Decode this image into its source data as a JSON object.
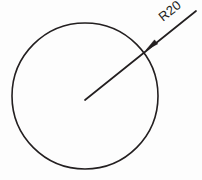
{
  "drawing": {
    "title": "Circle with radius dimension",
    "background_color": "#fdfdfd",
    "line_color": "#231f20",
    "width": 202,
    "height": 180
  },
  "circle": {
    "name": "circle",
    "center_x": 85,
    "center_y": 96,
    "radius_px": 73,
    "stroke_width": 1.6
  },
  "leader": {
    "name": "radius-leader-line",
    "start_x": 85,
    "start_y": 100,
    "end_x": 196,
    "end_y": 11,
    "arrow_x": 146,
    "arrow_y": 50,
    "angle_deg": -38.7
  },
  "dimension": {
    "label": "R20",
    "prefix": "R",
    "value": 20,
    "rotation_deg": -38.7,
    "text_x": 163,
    "text_y": 22
  },
  "chart_data": {
    "type": "diagram",
    "annotations": [
      "R20"
    ],
    "entities": [
      {
        "kind": "circle",
        "center": [
          85,
          96
        ],
        "radius": 73,
        "label": "circle-outline"
      },
      {
        "kind": "leader-line",
        "from": [
          85,
          100
        ],
        "to": [
          196,
          11
        ],
        "arrow_at": [
          146,
          50
        ],
        "label": "R20"
      }
    ]
  }
}
